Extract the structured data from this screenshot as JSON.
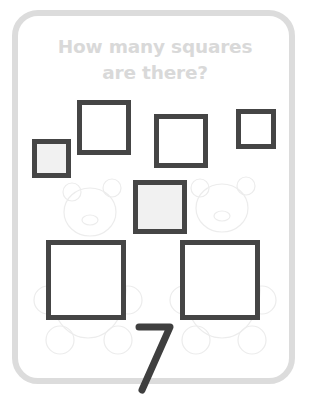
{
  "worksheet": {
    "question_line1": "How many squares",
    "question_line2": "are there?",
    "answer": "7",
    "colors": {
      "card_border": "#dcdcdc",
      "title_text": "#d9d9d9",
      "square_stroke": "#454545",
      "square_tint": "#f1f1f1",
      "answer_stroke": "#3f3f3f",
      "bear_outline": "#ececec"
    },
    "squares": [
      {
        "id": "a",
        "x": 32,
        "y": 139,
        "size": 39,
        "tinted": true
      },
      {
        "id": "b",
        "x": 77,
        "y": 100,
        "size": 54,
        "tinted": false
      },
      {
        "id": "c",
        "x": 154,
        "y": 114,
        "size": 54,
        "tinted": false
      },
      {
        "id": "d",
        "x": 236,
        "y": 109,
        "size": 40,
        "tinted": false
      },
      {
        "id": "e",
        "x": 133,
        "y": 180,
        "size": 54,
        "tinted": true
      },
      {
        "id": "f",
        "x": 46,
        "y": 240,
        "size": 80,
        "tinted": false
      },
      {
        "id": "g",
        "x": 180,
        "y": 240,
        "size": 80,
        "tinted": false
      }
    ],
    "background_images": [
      "teddy-bear-left",
      "teddy-bear-right"
    ]
  }
}
